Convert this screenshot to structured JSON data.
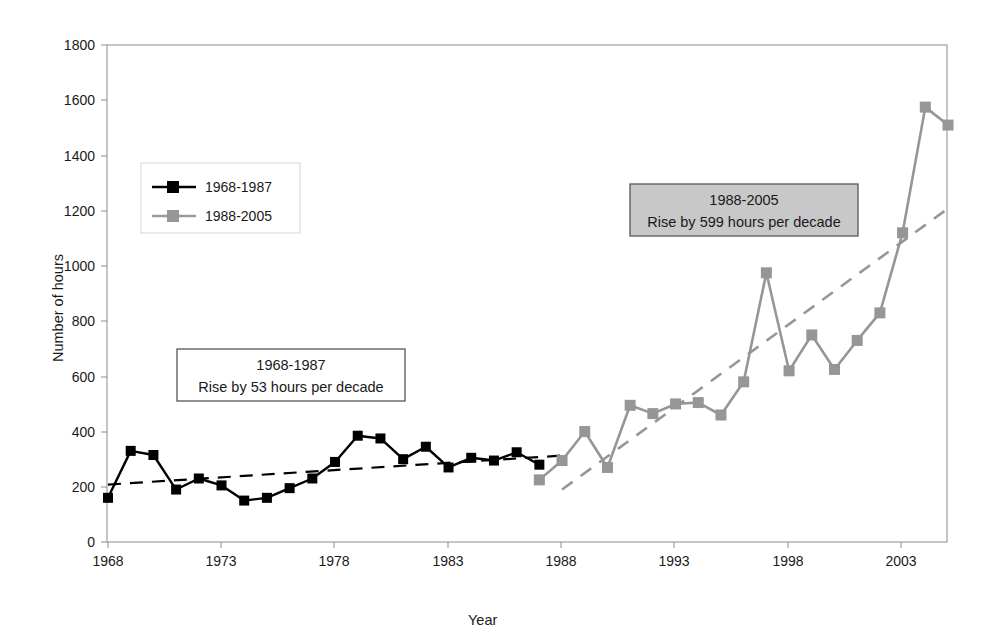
{
  "chart_data": {
    "type": "line",
    "title": "",
    "xlabel": "Year",
    "ylabel": "Number of hours",
    "xlim": [
      1968,
      2005
    ],
    "ylim": [
      0,
      1800
    ],
    "ytick_labels": [
      "0",
      "200",
      "400",
      "600",
      "800",
      "1000",
      "1200",
      "1400",
      "1600",
      "1800"
    ],
    "ytick_values": [
      0,
      200,
      400,
      600,
      800,
      1000,
      1200,
      1400,
      1600,
      1800
    ],
    "xtick_labels": [
      "1968",
      "1973",
      "1978",
      "1983",
      "1988",
      "1993",
      "1998",
      "2003"
    ],
    "xtick_values": [
      1968,
      1973,
      1978,
      1983,
      1988,
      1993,
      1998,
      2003
    ],
    "grid": false,
    "legend_position": "upper-left-inside",
    "series": [
      {
        "name": "1968-1987",
        "color": "#000000",
        "marker": "square",
        "x": [
          1968,
          1969,
          1970,
          1971,
          1972,
          1973,
          1974,
          1975,
          1976,
          1977,
          1978,
          1979,
          1980,
          1981,
          1982,
          1983,
          1984,
          1985,
          1986,
          1987
        ],
        "values": [
          160,
          330,
          315,
          190,
          230,
          205,
          150,
          160,
          195,
          230,
          290,
          385,
          375,
          300,
          345,
          270,
          305,
          295,
          325,
          280
        ]
      },
      {
        "name": "1988-2005",
        "color": "#969696",
        "marker": "square",
        "x": [
          1987,
          1988,
          1989,
          1990,
          1991,
          1992,
          1993,
          1994,
          1995,
          1996,
          1997,
          1998,
          1999,
          2000,
          2001,
          2002,
          2003,
          2004,
          2005
        ],
        "values": [
          225,
          295,
          400,
          270,
          495,
          465,
          500,
          505,
          460,
          580,
          975,
          620,
          750,
          625,
          730,
          830,
          1120,
          1575,
          1510
        ]
      }
    ],
    "trendlines": [
      {
        "name": "1968-1987 trend",
        "color": "#000000",
        "style": "dashed",
        "x_start": 1968,
        "y_start": 208,
        "x_end": 1988,
        "y_end": 313,
        "rise_per_decade": 53
      },
      {
        "name": "1988-2005 trend",
        "color": "#969696",
        "style": "dashed",
        "x_start": 1988,
        "y_start": 190,
        "x_end": 2005,
        "y_end": 1208,
        "rise_per_decade": 599
      }
    ],
    "annotations": [
      {
        "id": "anno-1968-1987",
        "line1": "1968-1987",
        "line2": "Rise by 53 hours per decade",
        "background": "#ffffff",
        "border": "#555555"
      },
      {
        "id": "anno-1988-2005",
        "line1": "1988-2005",
        "line2": "Rise by 599 hours per decade",
        "background": "#c8c8c8",
        "border": "#555555"
      }
    ],
    "legend": {
      "entries": [
        {
          "label": "1968-1987",
          "color": "#000000"
        },
        {
          "label": "1988-2005",
          "color": "#969696"
        }
      ],
      "border": "#d0d0d0"
    },
    "plot_area_border": "#808080"
  }
}
